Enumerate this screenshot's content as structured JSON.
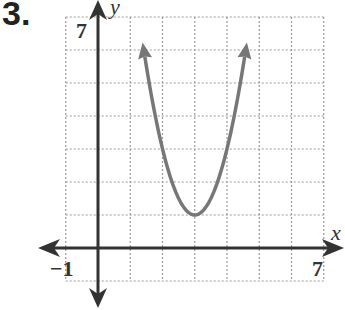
{
  "problem_number": "3.",
  "chart_data": {
    "type": "line",
    "title": "",
    "xlabel": "x",
    "ylabel": "y",
    "xlim": [
      -1,
      7
    ],
    "ylim": [
      -1,
      7
    ],
    "grid": true,
    "grid_style": "dotted",
    "tick_labels": {
      "x_min": "−1",
      "x_max": "7",
      "y_max": "7"
    },
    "series": [
      {
        "name": "parabola",
        "equation": "y = 2(x - 3)^2 + 1",
        "vertex": [
          3,
          1
        ],
        "arrows_at_ends": true,
        "color": "#777777",
        "x": [
          1.4,
          1.75,
          2.0,
          2.25,
          2.5,
          2.75,
          3.0,
          3.25,
          3.5,
          3.75,
          4.0,
          4.25,
          4.6
        ],
        "y": [
          6.12,
          4.125,
          3.0,
          2.125,
          1.5,
          1.125,
          1.0,
          1.125,
          1.5,
          2.125,
          3.0,
          4.125,
          6.12
        ]
      }
    ]
  }
}
